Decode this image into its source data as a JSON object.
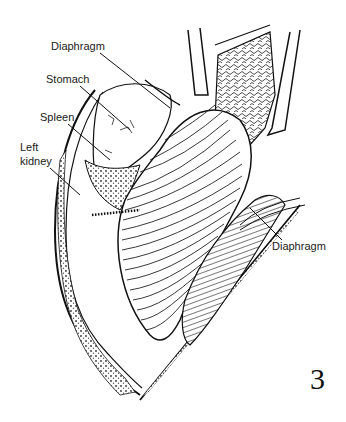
{
  "figure": {
    "number": "3",
    "labels": {
      "diaphragm_top": "Diaphragm",
      "stomach": "Stomach",
      "spleen": "Spleen",
      "left_kidney_line1": "Left",
      "left_kidney_line2": "kidney",
      "diaphragm_right": "Diaphragm"
    }
  }
}
